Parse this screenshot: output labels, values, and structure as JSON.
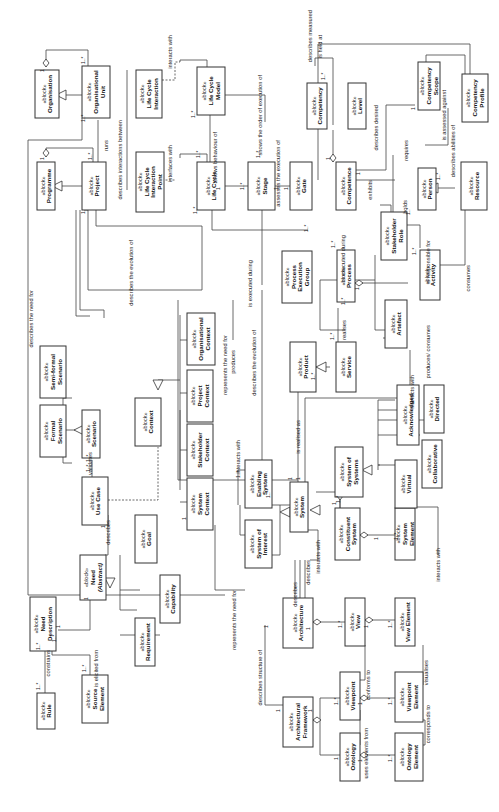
{
  "diagram": {
    "stereotype": "«block»",
    "blocks": [
      {
        "id": "organisation",
        "name": "Organisation"
      },
      {
        "id": "organisational_unit",
        "name": "Organisational Unit"
      },
      {
        "id": "programme",
        "name": "Programme"
      },
      {
        "id": "project",
        "name": "Project"
      },
      {
        "id": "life_cycle_interaction",
        "name": "Life Cycle Interaction"
      },
      {
        "id": "life_cycle_interaction_point",
        "name": "Life Cycle Interaction Point"
      },
      {
        "id": "life_cycle_model",
        "name": "Life Cycle Model"
      },
      {
        "id": "life_cycle",
        "name": "Life Cycle"
      },
      {
        "id": "stage",
        "name": "Stage"
      },
      {
        "id": "gate",
        "name": "Gate"
      },
      {
        "id": "competency",
        "name": "Competency"
      },
      {
        "id": "level",
        "name": "Level"
      },
      {
        "id": "competence",
        "name": "Competence"
      },
      {
        "id": "competency_scope",
        "name": "Competency Scope"
      },
      {
        "id": "competency_profile",
        "name": "Competency Profile"
      },
      {
        "id": "person",
        "name": "Person"
      },
      {
        "id": "resource",
        "name": "Resource"
      },
      {
        "id": "stakeholder_role",
        "name": "Stakeholder Role"
      },
      {
        "id": "process_execution_group",
        "name": "Process Execution Group"
      },
      {
        "id": "process",
        "name": "Process"
      },
      {
        "id": "activity",
        "name": "Activity"
      },
      {
        "id": "artefact",
        "name": "Artefact"
      },
      {
        "id": "service",
        "name": "Service"
      },
      {
        "id": "product",
        "name": "Product"
      },
      {
        "id": "semi_formal_scenario",
        "name": "Semi-formal Scenario"
      },
      {
        "id": "formal_scenario",
        "name": "Formal Scenario"
      },
      {
        "id": "scenario",
        "name": "Scenario"
      },
      {
        "id": "context",
        "name": "Context"
      },
      {
        "id": "organisational_context",
        "name": "Organisational Context"
      },
      {
        "id": "project_context",
        "name": "Project Context"
      },
      {
        "id": "stakeholder_context",
        "name": "Stakeholder Context"
      },
      {
        "id": "system_context",
        "name": "System Context"
      },
      {
        "id": "use_case",
        "name": "Use Case"
      },
      {
        "id": "goal",
        "name": "Goal"
      },
      {
        "id": "capability",
        "name": "Capability"
      },
      {
        "id": "requirement",
        "name": "Requirement"
      },
      {
        "id": "need",
        "name": "Need",
        "note": "(Abstract)"
      },
      {
        "id": "need_description",
        "name": "Need Description"
      },
      {
        "id": "rule",
        "name": "Rule"
      },
      {
        "id": "source_element",
        "name": "Source Element"
      },
      {
        "id": "enabling_system",
        "name": "Enabling System"
      },
      {
        "id": "system_of_interest",
        "name": "System of Interest"
      },
      {
        "id": "system",
        "name": "System"
      },
      {
        "id": "system_of_systems",
        "name": "System of Systems"
      },
      {
        "id": "constituent_system",
        "name": "Constituent System"
      },
      {
        "id": "system_element",
        "name": "System Element"
      },
      {
        "id": "virtual",
        "name": "Virtual"
      },
      {
        "id": "collaborative",
        "name": "Collaborative"
      },
      {
        "id": "acknowledged",
        "name": "Acknowledged"
      },
      {
        "id": "directed",
        "name": "Directed"
      },
      {
        "id": "architecture",
        "name": "Architecture"
      },
      {
        "id": "view",
        "name": "View"
      },
      {
        "id": "view_element",
        "name": "View Element"
      },
      {
        "id": "architectural_framework",
        "name": "Architectural Framework"
      },
      {
        "id": "viewpoint",
        "name": "Viewpoint"
      },
      {
        "id": "viewpoint_element",
        "name": "Viewpoint Element"
      },
      {
        "id": "ontology",
        "name": "Ontology"
      },
      {
        "id": "ontology_element",
        "name": "Ontology Element"
      }
    ],
    "relationships": {
      "runs": "runs",
      "describes_interactions_between": "describes interactions between",
      "interacts_with": "interacts with",
      "interfaces_with": "interfaces with",
      "shows_behaviour_of": "shows behaviour of",
      "shows_order": "shows the order of execution of",
      "assesses": "assesses the execution of",
      "describes_measured": "describes measured",
      "is_held_at": "is held at",
      "describes_desired": "describes desired",
      "is_assessed_against": "is assessed against",
      "requires": "requires",
      "describes_abilities": "describes abilities of",
      "exhibits": "exhibits",
      "holds": "holds",
      "is_responsible_for": "is responsible for",
      "consumes": "consumes",
      "is_executed_during_1": "is executed during",
      "is_executed_during_2": "is executed during",
      "realises": "realises",
      "produces_consumes": "produces/ consumes",
      "describes_evolution_1": "describes the evolution of",
      "describes_evolution_2": "describes the evolution of",
      "describes_need_for": "describes the need for",
      "represents_need_for_1": "represents the need for",
      "produces": "produces",
      "is_realised_as": "is realised as",
      "interacts_with_2": "interacts with",
      "interacts_with_3": "interacts with",
      "interacts_with_4": "interacts with",
      "interacts_with_5": "interacts with",
      "validates": "validates",
      "describes_1": "describes",
      "describes_2": "describes",
      "describes_3": "describes",
      "constrains": "constrains",
      "is_elicited_from": "is elicited from",
      "represents_need_for_2": "represents the need for",
      "describes_structure": "describes structure of",
      "conforms_to": "conforms to",
      "visualises": "visualises",
      "uses_elements_from": "uses elements from",
      "corresponds_to": "corresponds to"
    },
    "multiplicities": {
      "one": "1",
      "many": "1..*"
    }
  }
}
